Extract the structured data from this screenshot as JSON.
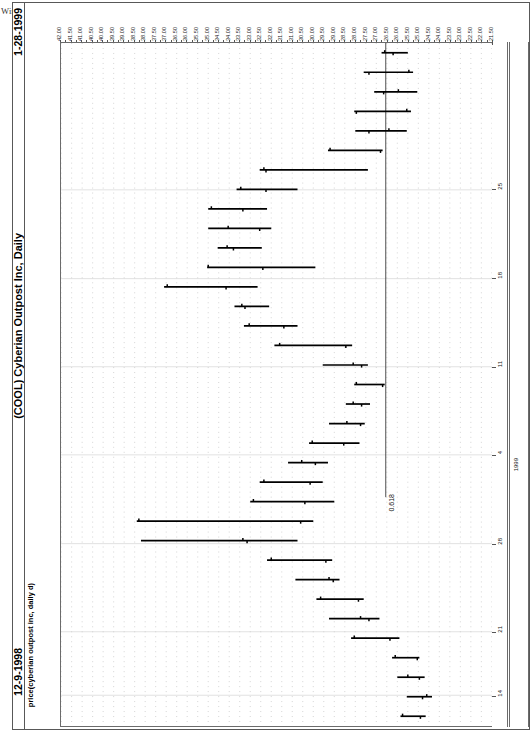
{
  "meta": {
    "copyright": "Window on Wall Street © 1999",
    "date_end": "1-28-1999",
    "date_start": "12-9-1998",
    "main_title": "(COOL) Cyberian Outpost Inc, Daily",
    "sub_title": "price(cyberian outpost inc, daily d)"
  },
  "annotations": {
    "fib_label": "0.618"
  },
  "chart_data": {
    "type": "ohlc-bar",
    "title": "(COOL) Cyberian Outpost Inc, Daily",
    "orientation": "rotated-90ccw",
    "xlabel": "date",
    "ylabel": "price(cyberian outpost inc, daily d)",
    "ylim": [
      21.5,
      42.0
    ],
    "grid": true,
    "legend": null,
    "price_ticks": [
      "42.00",
      "41.50",
      "41.00",
      "40.50",
      "40.00",
      "39.50",
      "39.00",
      "38.50",
      "38.00",
      "37.50",
      "37.00",
      "36.50",
      "36.00",
      "35.50",
      "35.00",
      "34.50",
      "34.00",
      "33.50",
      "33.00",
      "32.50",
      "32.00",
      "31.50",
      "31.00",
      "30.50",
      "30.00",
      "29.50",
      "29.00",
      "28.50",
      "28.00",
      "27.50",
      "27.00",
      "26.50",
      "26.00",
      "25.50",
      "25.00",
      "24.50",
      "24.00",
      "23.50",
      "23.00",
      "22.50",
      "22.00",
      "21.50"
    ],
    "date_ticks": [
      {
        "label": "25",
        "pos": 0.215
      },
      {
        "label": "18",
        "pos": 0.345
      },
      {
        "label": "11",
        "pos": 0.474
      },
      {
        "label": "4",
        "pos": 0.603
      },
      {
        "label": "28",
        "pos": 0.733
      },
      {
        "label": "21",
        "pos": 0.862
      },
      {
        "label": "14",
        "pos": 0.955
      }
    ],
    "year_ticks": [
      {
        "label": "1999",
        "pos": 0.625
      }
    ],
    "fib_level": {
      "label": "0.618",
      "price": 26.55
    },
    "series_name": "COOL daily OHLC",
    "bars": [
      {
        "i": 1,
        "high": 26.75,
        "low": 25.5,
        "open": 26.6,
        "close": 26.2
      },
      {
        "i": 2,
        "high": 27.6,
        "low": 25.25,
        "open": 25.45,
        "close": 27.35
      },
      {
        "i": 3,
        "high": 27.1,
        "low": 25.05,
        "open": 25.95,
        "close": 26.65
      },
      {
        "i": 4,
        "high": 28.05,
        "low": 25.35,
        "open": 25.55,
        "close": 27.95
      },
      {
        "i": 5,
        "high": 28.0,
        "low": 25.55,
        "open": 26.4,
        "close": 27.35
      },
      {
        "i": 6,
        "high": 29.3,
        "low": 26.7,
        "open": 29.2,
        "close": 26.8
      },
      {
        "i": 7,
        "high": 32.55,
        "low": 27.4,
        "open": 32.35,
        "close": 32.25
      },
      {
        "i": 8,
        "high": 33.65,
        "low": 30.75,
        "open": 33.45,
        "close": 32.25
      },
      {
        "i": 9,
        "high": 35.0,
        "low": 32.2,
        "open": 34.85,
        "close": 33.35
      },
      {
        "i": 10,
        "high": 35.0,
        "low": 32.0,
        "open": 34.05,
        "close": 32.55
      },
      {
        "i": 11,
        "high": 34.55,
        "low": 32.45,
        "open": 34.1,
        "close": 33.8
      },
      {
        "i": 12,
        "high": 35.05,
        "low": 29.9,
        "open": 35.0,
        "close": 32.4
      },
      {
        "i": 13,
        "high": 37.1,
        "low": 32.65,
        "open": 36.95,
        "close": 34.15
      },
      {
        "i": 14,
        "high": 33.75,
        "low": 32.1,
        "open": 33.4,
        "close": 33.25
      },
      {
        "i": 15,
        "high": 33.3,
        "low": 30.75,
        "open": 33.05,
        "close": 31.4
      },
      {
        "i": 16,
        "high": 31.85,
        "low": 28.15,
        "open": 31.6,
        "close": 28.45
      },
      {
        "i": 17,
        "high": 29.55,
        "low": 27.4,
        "open": 28.1,
        "close": 27.7
      },
      {
        "i": 18,
        "high": 28.05,
        "low": 26.6,
        "open": 27.95,
        "close": 26.7
      },
      {
        "i": 19,
        "high": 28.45,
        "low": 27.3,
        "open": 28.1,
        "close": 27.7
      },
      {
        "i": 20,
        "high": 29.25,
        "low": 27.55,
        "open": 28.4,
        "close": 27.75
      },
      {
        "i": 21,
        "high": 30.2,
        "low": 27.8,
        "open": 30.05,
        "close": 28.55
      },
      {
        "i": 22,
        "high": 31.2,
        "low": 29.3,
        "open": 30.55,
        "close": 29.9
      },
      {
        "i": 23,
        "high": 32.55,
        "low": 29.55,
        "open": 32.35,
        "close": 30.15
      },
      {
        "i": 24,
        "high": 33.0,
        "low": 29.0,
        "open": 32.85,
        "close": 30.4
      },
      {
        "i": 25,
        "high": 38.4,
        "low": 30.0,
        "open": 38.3,
        "close": 30.6
      },
      {
        "i": 26,
        "high": 38.2,
        "low": 30.75,
        "open": 33.35,
        "close": 33.15
      },
      {
        "i": 27,
        "high": 32.2,
        "low": 29.1,
        "open": 32.0,
        "close": 29.4
      },
      {
        "i": 28,
        "high": 30.85,
        "low": 28.75,
        "open": 29.25,
        "close": 29.05
      },
      {
        "i": 29,
        "high": 29.85,
        "low": 27.6,
        "open": 29.65,
        "close": 27.85
      },
      {
        "i": 30,
        "high": 29.25,
        "low": 26.85,
        "open": 27.75,
        "close": 27.35
      },
      {
        "i": 31,
        "high": 28.2,
        "low": 25.9,
        "open": 28.05,
        "close": 26.35
      },
      {
        "i": 32,
        "high": 26.25,
        "low": 24.95,
        "open": 26.1,
        "close": 25.05
      },
      {
        "i": 33,
        "high": 26.0,
        "low": 24.7,
        "open": 25.5,
        "close": 24.95
      },
      {
        "i": 34,
        "high": 25.55,
        "low": 24.35,
        "open": 24.6,
        "close": 24.8
      },
      {
        "i": 35,
        "high": 25.85,
        "low": 24.65,
        "open": 25.75,
        "close": 24.9
      }
    ]
  }
}
